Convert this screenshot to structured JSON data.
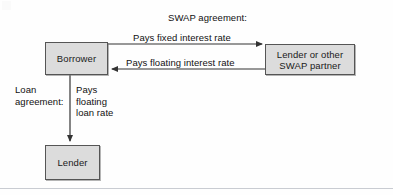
{
  "diagram": {
    "colors": {
      "node_fill": "#dcdcdc",
      "node_border": "#555555",
      "line": "#333333",
      "text": "#111111",
      "background": "#fefefe",
      "rule": "#c9ccd2"
    },
    "nodes": [
      {
        "id": "borrower",
        "label": "Borrower"
      },
      {
        "id": "swap-partner",
        "label": "Lender or other\nSWAP partner"
      },
      {
        "id": "lender",
        "label": "Lender"
      }
    ],
    "captions": {
      "swap_title": "SWAP agreement:",
      "fixed_rate": "Pays fixed interest rate",
      "floating_rate": "Pays floating interest rate",
      "loan_agreement": "Loan\nagreement:",
      "floating_loan": "Pays\nfloating\nloan rate"
    },
    "edges": [
      {
        "id": "borrower-to-partner",
        "label": "Pays fixed interest rate",
        "from": "borrower",
        "to": "swap-partner",
        "direction": "right"
      },
      {
        "id": "partner-to-borrower",
        "label": "Pays floating interest rate",
        "from": "swap-partner",
        "to": "borrower",
        "direction": "left"
      },
      {
        "id": "borrower-to-lender",
        "label": "Pays floating loan rate",
        "from": "borrower",
        "to": "lender",
        "direction": "down"
      }
    ]
  }
}
